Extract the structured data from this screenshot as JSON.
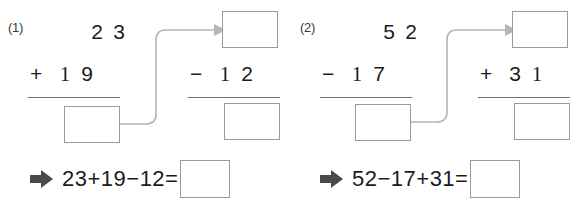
{
  "worksheet": {
    "title": "Three-term addition and subtraction worksheet",
    "colors": {
      "box_border": "#9a9a9a",
      "rule_line": "#6f6f6f",
      "connector": "#b5b5b5",
      "arrow_glyph": "#4a4a4a",
      "text": "#1c1c1c",
      "label": "#3a3a3a",
      "background": "#ffffff"
    },
    "problems": [
      {
        "id": "1",
        "label": "(1)",
        "left_column": {
          "top_number": {
            "tens": "2",
            "ones": "3"
          },
          "operator": "+",
          "bottom_number": {
            "tens": "1",
            "ones": "9"
          },
          "result_box_value": ""
        },
        "right_column": {
          "top_box_value": "",
          "operator": "−",
          "bottom_number": {
            "tens": "1",
            "ones": "2"
          },
          "result_box_value": ""
        },
        "equation": {
          "arrow": "arrow-right-icon",
          "expression": "23+19−12=",
          "answer_box_value": ""
        }
      },
      {
        "id": "2",
        "label": "(2)",
        "left_column": {
          "top_number": {
            "tens": "5",
            "ones": "2"
          },
          "operator": "−",
          "bottom_number": {
            "tens": "1",
            "ones": "7"
          },
          "result_box_value": ""
        },
        "right_column": {
          "top_box_value": "",
          "operator": "+",
          "bottom_number": {
            "tens": "3",
            "ones": "1"
          },
          "result_box_value": ""
        },
        "equation": {
          "arrow": "arrow-right-icon",
          "expression": "52−17+31=",
          "answer_box_value": ""
        }
      }
    ]
  }
}
